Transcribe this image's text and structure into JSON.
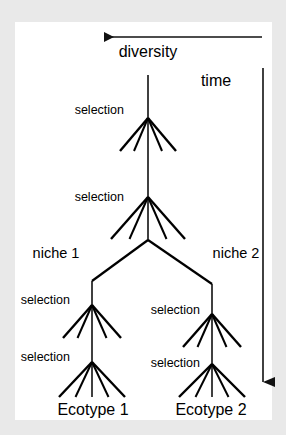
{
  "figure": {
    "background_color": "#e9e9e9",
    "panel_color": "#ffffff",
    "ink_color": "#000000",
    "width": 286,
    "height": 435
  },
  "axes": [
    {
      "name": "diversity-axis",
      "label": "diversity",
      "orientation": "horizontal",
      "direction": "left",
      "label_x": 148,
      "label_y": 52,
      "line_x1": 262,
      "line_x2": 104,
      "line_y": 37
    },
    {
      "name": "time-axis",
      "label": "time",
      "orientation": "vertical",
      "direction": "down",
      "label_x": 216,
      "label_y": 81,
      "line_x": 263,
      "line_y1": 68,
      "line_y2": 382
    }
  ],
  "niche_labels": [
    {
      "name": "niche-1-label",
      "text": "niche 1",
      "x": 56,
      "y": 253
    },
    {
      "name": "niche-2-label",
      "text": "niche 2",
      "x": 236,
      "y": 253
    }
  ],
  "ecotype_labels": [
    {
      "name": "ecotype-1-label",
      "text": "Ecotype 1",
      "x": 93,
      "y": 410
    },
    {
      "name": "ecotype-2-label",
      "text": "Ecotype 2",
      "x": 211,
      "y": 410
    }
  ],
  "selection_labels": [
    {
      "name": "selection-label-1",
      "text": "selection",
      "x": 124,
      "y": 110,
      "align": "right"
    },
    {
      "name": "selection-label-2",
      "text": "selection",
      "x": 124,
      "y": 197,
      "align": "right"
    },
    {
      "name": "selection-label-3",
      "text": "selection",
      "x": 70,
      "y": 300,
      "align": "right"
    },
    {
      "name": "selection-label-4",
      "text": "selection",
      "x": 70,
      "y": 357,
      "align": "right"
    },
    {
      "name": "selection-label-5",
      "text": "selection",
      "x": 200,
      "y": 310,
      "align": "right"
    },
    {
      "name": "selection-label-6",
      "text": "selection",
      "x": 200,
      "y": 363,
      "align": "right"
    }
  ],
  "tree": {
    "trunk_x": 148,
    "trunk_top_y": 75,
    "nodes": [
      {
        "name": "node-selection-1",
        "x": 148,
        "y": 118,
        "fan_dy": 33,
        "fan_spread": 56,
        "branches": 5
      },
      {
        "name": "node-selection-2",
        "x": 148,
        "y": 197,
        "fan_dy": 42,
        "fan_spread": 74,
        "branches": 5
      },
      {
        "name": "node-split",
        "x": 148,
        "y": 240
      },
      {
        "name": "node-selection-3",
        "x": 92,
        "y": 305,
        "fan_dy": 33,
        "fan_spread": 58,
        "branches": 5
      },
      {
        "name": "node-selection-4",
        "x": 92,
        "y": 362,
        "fan_dy": 35,
        "fan_spread": 66,
        "branches": 5
      },
      {
        "name": "node-selection-5",
        "x": 212,
        "y": 314,
        "fan_dy": 33,
        "fan_spread": 58,
        "branches": 5
      },
      {
        "name": "node-selection-6",
        "x": 212,
        "y": 364,
        "fan_dy": 33,
        "fan_spread": 66,
        "branches": 5
      }
    ],
    "split": {
      "from_x": 148,
      "from_y": 240,
      "left_x": 92,
      "left_y": 281,
      "right_x": 212,
      "right_y": 284
    }
  }
}
